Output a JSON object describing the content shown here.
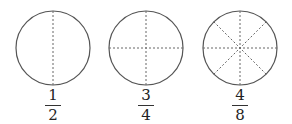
{
  "diagram": {
    "figures": [
      {
        "numerator": "1",
        "denominator": "2",
        "divisions": 2
      },
      {
        "numerator": "3",
        "denominator": "4",
        "divisions": 4
      },
      {
        "numerator": "4",
        "denominator": "8",
        "divisions": 8
      }
    ],
    "colors": {
      "stroke": "#555555",
      "dash": "#666666",
      "text": "#222222"
    }
  }
}
